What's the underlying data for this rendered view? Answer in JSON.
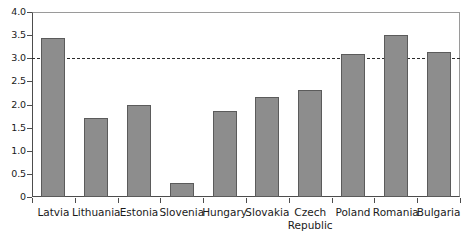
{
  "chart_data": {
    "type": "bar",
    "title": "",
    "subtitle": "",
    "xlabel": "",
    "ylabel": "",
    "categories": [
      "Latvia",
      "Lithuania",
      "Estonia",
      "Slovenia",
      "Hungary",
      "Slovakia",
      "Czech Republic",
      "Poland",
      "Romania",
      "Bulgaria"
    ],
    "category_lines": [
      [
        "Latvia"
      ],
      [
        "Lithuania"
      ],
      [
        "Estonia"
      ],
      [
        "Slovenia"
      ],
      [
        "Hungary"
      ],
      [
        "Slovakia"
      ],
      [
        "Czech",
        "Republic"
      ],
      [
        "Poland"
      ],
      [
        "Romania"
      ],
      [
        "Bulgaria"
      ]
    ],
    "values": [
      3.44,
      1.7,
      2.0,
      0.3,
      1.86,
      2.16,
      2.31,
      3.09,
      3.5,
      3.13
    ],
    "ylim": [
      0,
      4.0
    ],
    "ytick_labels": [
      "0",
      "0.5",
      "1.0",
      "1.5",
      "2.0",
      "2.5",
      "3.0",
      "3.5",
      "4.0"
    ],
    "ytick_values": [
      0,
      0.5,
      1.0,
      1.5,
      2.0,
      2.5,
      3.0,
      3.5,
      4.0
    ],
    "grid": false,
    "legend": null,
    "legend_position": "none",
    "annotations": [
      {
        "name": "threshold-line",
        "type": "horizontal-dashed-line",
        "value": 3.0
      }
    ],
    "style": {
      "bar_fill": "#8d8d8d",
      "bar_border": "#5b5b5b",
      "axis_color": "#4d4d4d",
      "threshold_color": "#2b2b2b",
      "background": "#ffffff"
    }
  }
}
